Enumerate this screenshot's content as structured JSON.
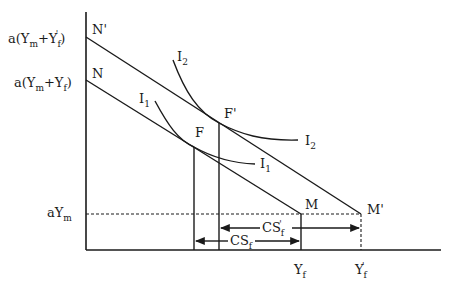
{
  "diagram": {
    "type": "economics-budget-constraint-indifference",
    "y_axis_labels": {
      "top": {
        "prefix": "a(Y",
        "sub1": "m",
        "mid": "+Y",
        "sub2": "f",
        "prime": "'",
        "suffix": ")"
      },
      "mid": {
        "prefix": "a(Y",
        "sub1": "m",
        "mid": "+Y",
        "sub2": "f",
        "suffix": ")"
      },
      "low": {
        "prefix": "aY",
        "sub1": "m"
      }
    },
    "x_axis_labels": {
      "yf": {
        "main": "Y",
        "sub": "f"
      },
      "yf_prime": {
        "main": "Y",
        "sub": "f",
        "prime": "'"
      }
    },
    "points": {
      "N_prime": "N'",
      "N": "N",
      "F": "F",
      "F_prime": "F'",
      "M": "M",
      "M_prime": "M'"
    },
    "curves": {
      "I1": {
        "main": "I",
        "sub": "1"
      },
      "I2": {
        "main": "I",
        "sub": "2"
      }
    },
    "arrows": {
      "cs_f": {
        "main": "CS",
        "sub": "f"
      },
      "cs_f_prime": {
        "main": "CS",
        "sub": "f",
        "prime": "'"
      }
    }
  }
}
